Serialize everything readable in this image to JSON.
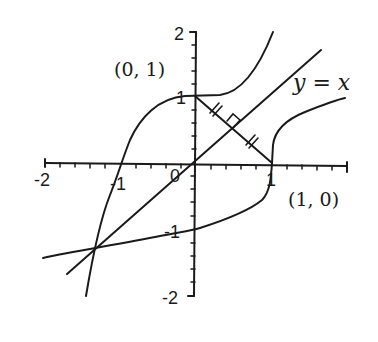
{
  "diagram": {
    "axes": {
      "x_ticks": [
        "-2",
        "-1",
        "0",
        "1"
      ],
      "y_ticks": [
        "2",
        "1",
        "-1",
        "-2"
      ],
      "x_range": [
        -2,
        2
      ],
      "y_range": [
        -2,
        2
      ]
    },
    "labels": {
      "point_a": "(0, 1)",
      "point_b": "(1, 0)",
      "line_eq": "y = x"
    },
    "colors": {
      "ink": "#1a1a1a",
      "background": "#ffffff"
    }
  }
}
